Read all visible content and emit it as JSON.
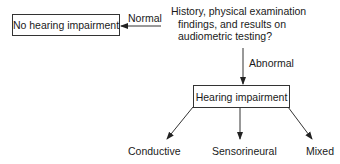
{
  "diagram": {
    "type": "flowchart",
    "question": {
      "lines": [
        "History, physical examination",
        "findings, and results on",
        "audiometric testing?"
      ]
    },
    "nodes": {
      "no_impairment": "No hearing impairment",
      "impairment": "Hearing impairment"
    },
    "edges": {
      "normal": "Normal",
      "abnormal": "Abnormal"
    },
    "outcomes": [
      "Conductive",
      "Sensorineural",
      "Mixed"
    ],
    "colors": {
      "line": "#333333",
      "text": "#1a1a1a",
      "background": "#ffffff"
    }
  }
}
